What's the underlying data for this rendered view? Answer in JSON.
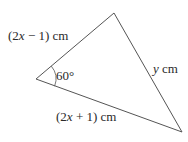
{
  "diagram": {
    "type": "triangle",
    "vertices": {
      "left": [
        36,
        79
      ],
      "top": [
        114,
        13
      ],
      "bottom_right": [
        182,
        132
      ]
    },
    "angle": {
      "vertex": "left",
      "value": "60°"
    },
    "sides": [
      {
        "id": "top-left",
        "label_prefix": "(2",
        "label_var": "x",
        "label_suffix": " − 1) cm"
      },
      {
        "id": "bottom",
        "label_prefix": "(2",
        "label_var": "x",
        "label_suffix": " + 1) cm"
      },
      {
        "id": "right",
        "label_var": "y",
        "label_suffix": " cm"
      }
    ],
    "stroke_color": "#555555",
    "text_color": "#2a2a2a"
  }
}
